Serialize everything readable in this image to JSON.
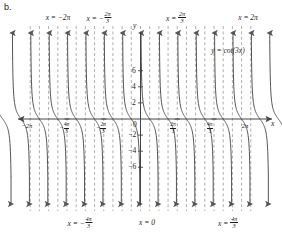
{
  "panel": {
    "label": "b."
  },
  "chart_data": {
    "type": "line",
    "title": "",
    "function_label": "y = cot(3x)",
    "xlabel": "x",
    "ylabel": "y",
    "xlim": [
      -6.8068,
      6.8068
    ],
    "ylim": [
      -7.2,
      7.2
    ],
    "grid": false,
    "legend_position": "inside-right",
    "period": "pi/3",
    "asymptote_values": [
      -6.2832,
      -5.7596,
      -5.236,
      -4.7124,
      -4.1888,
      -3.6652,
      -3.1416,
      -2.618,
      -2.0944,
      -1.5708,
      -1.0472,
      -0.5236,
      0,
      0.5236,
      1.0472,
      1.5708,
      2.0944,
      2.618,
      3.1416,
      3.6652,
      4.1888,
      4.7124,
      5.236,
      5.7596,
      6.2832
    ],
    "asymptote_count": 25,
    "branch_shape": "decreasing",
    "y_ticks": [
      6,
      4,
      2,
      0,
      -2,
      -4,
      -6
    ],
    "y_tick_labels": [
      "6",
      "4",
      "2",
      "0",
      "-2",
      "-4",
      "-6"
    ],
    "x_ticks": [
      -6.2832,
      -4.1888,
      -2.0944,
      0,
      2.0944,
      4.1888,
      6.2832
    ],
    "x_tick_labels": [
      "-2π",
      "-4π/3",
      "-2π/3",
      "0",
      "2π/3",
      "4π/3",
      "2π"
    ]
  },
  "axes": {
    "y_axis_name": "y",
    "x_axis_name": "x",
    "y_ticks": [
      {
        "value": 6,
        "label": "6"
      },
      {
        "value": 4,
        "label": "4"
      },
      {
        "value": 2,
        "label": "2"
      },
      {
        "value": 0,
        "label": "0"
      },
      {
        "value": -2,
        "label": "−2"
      },
      {
        "value": -4,
        "label": "−4"
      },
      {
        "value": -6,
        "label": "−6"
      }
    ],
    "x_ticks": [
      {
        "value": -6.2832,
        "kind": "plain",
        "label": "−2π"
      },
      {
        "value": -4.1888,
        "kind": "fraction",
        "sign": "−",
        "numerator": "4π",
        "denominator": "3"
      },
      {
        "value": -2.0944,
        "kind": "fraction",
        "sign": "−",
        "numerator": "2π",
        "denominator": "3"
      },
      {
        "value": 0,
        "kind": "plain",
        "label": "0"
      },
      {
        "value": 2.0944,
        "kind": "fraction",
        "sign": "",
        "numerator": "2π",
        "denominator": "3"
      },
      {
        "value": 4.1888,
        "kind": "fraction",
        "sign": "",
        "numerator": "4π",
        "denominator": "3"
      },
      {
        "value": 6.2832,
        "kind": "plain",
        "label": "2π"
      }
    ]
  },
  "annotations": {
    "top": [
      {
        "prefix": "x = ",
        "kind": "plain",
        "label": "−2π",
        "x": 58,
        "y": 14
      },
      {
        "prefix": "x = ",
        "kind": "fraction",
        "sign": "−",
        "numerator": "2π",
        "denominator": "3",
        "x": 99,
        "y": 11
      },
      {
        "prefix": "x = ",
        "kind": "fraction",
        "sign": "",
        "numerator": "2π",
        "denominator": "3",
        "x": 176,
        "y": 11
      },
      {
        "prefix": "x = ",
        "kind": "plain",
        "label": "2π",
        "x": 248,
        "y": 14
      }
    ],
    "bottom": [
      {
        "prefix": "x = ",
        "kind": "fraction",
        "sign": "−",
        "numerator": "4π",
        "denominator": "3",
        "x": 80,
        "y": 216
      },
      {
        "prefix": "x = ",
        "kind": "plain",
        "label": "0",
        "x": 147,
        "y": 219
      },
      {
        "prefix": "x = ",
        "kind": "fraction",
        "sign": "",
        "numerator": "4π",
        "denominator": "3",
        "x": 228,
        "y": 216
      }
    ],
    "function": {
      "text_y": "y",
      "text_eq": " = cot(3",
      "text_var": "x",
      "text_close": ")",
      "full": "y = cot(3x)",
      "x": 228,
      "y": 47
    }
  },
  "colors": {
    "curve": "#555555",
    "asymptote": "#9a9a9a",
    "axis": "#444444",
    "text": "#1a1a1a",
    "background": "#ffffff"
  }
}
